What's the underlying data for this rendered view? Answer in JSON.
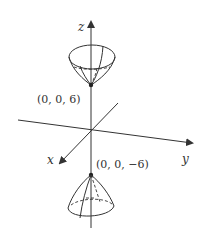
{
  "diagram": {
    "axes": {
      "x_label": "x",
      "y_label": "y",
      "z_label": "z"
    },
    "points": [
      {
        "name": "upper-vertex",
        "label": "(0, 0, 6)"
      },
      {
        "name": "lower-vertex",
        "label": "(0, 0, −6)"
      }
    ],
    "colors": {
      "ink": "#333333",
      "background": "#ffffff"
    }
  }
}
